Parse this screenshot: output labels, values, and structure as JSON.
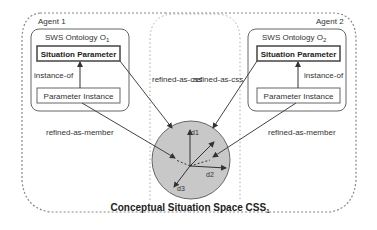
{
  "agents": [
    {
      "label": "Agent 1"
    },
    {
      "label": "Agent 2"
    }
  ],
  "ontologies": [
    {
      "title": "SWS Ontology O",
      "subscript": "1",
      "situation_parameter": "Situation Parameter",
      "parameter_instance": "Parameter Instance",
      "instance_of": "instance-of"
    },
    {
      "title": "SWS Ontology O",
      "subscript": "2",
      "situation_parameter": "Situation Parameter",
      "parameter_instance": "Parameter Instance",
      "instance_of": "instance-of"
    }
  ],
  "relations": {
    "refined_as_css_left": "refined-as-css",
    "refined_as_css_right": "refined-as-css",
    "refined_as_member_left": "refined-as-member",
    "refined_as_member_right": "refined-as-member"
  },
  "css": {
    "title": "Conceptual Situation Space CSS",
    "subscript": "1",
    "dimensions": [
      "d1",
      "d2",
      "d3"
    ]
  },
  "colors": {
    "circle_fill": "#c8c8c8",
    "line": "#555555",
    "dashed": "#888888"
  }
}
